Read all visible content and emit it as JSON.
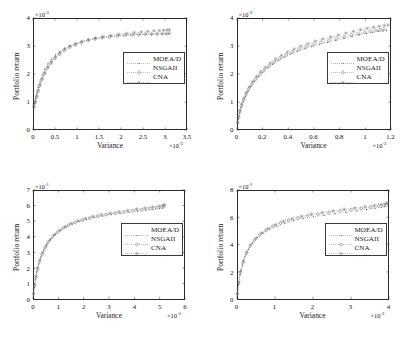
{
  "figure": {
    "layout": "2x2 grid of scatter/line plots",
    "background": "#ffffff",
    "axis_color": "#2b2b2b"
  },
  "legend": {
    "entries": [
      {
        "label": "MOEA/D",
        "marker": "dot",
        "color": "#555555"
      },
      {
        "label": "NSGAII",
        "marker": "diamond",
        "color": "#666666"
      },
      {
        "label": "CNA",
        "marker": "star",
        "color": "#777777"
      }
    ]
  },
  "chart_data": [
    {
      "id": "top-left",
      "type": "scatter",
      "title": "",
      "xlabel": "Variance",
      "ylabel": "Portfolio return",
      "x_multiplier": "×10",
      "x_exponent": "-3",
      "y_multiplier": "×10",
      "y_exponent": "-3",
      "xlim": [
        0,
        3.5
      ],
      "ylim": [
        0,
        4
      ],
      "xticks": [
        "0",
        "0.5",
        "1",
        "1.5",
        "2",
        "2.5",
        "3",
        "3.5"
      ],
      "yticks": [
        "0",
        "1",
        "2",
        "3",
        "4"
      ],
      "grid": false,
      "legend_position": "center-right",
      "series": [
        {
          "name": "MOEA/D",
          "x": [
            0.02,
            0.04,
            0.06,
            0.09,
            0.12,
            0.16,
            0.21,
            0.27,
            0.34,
            0.42,
            0.51,
            0.61,
            0.72,
            0.84,
            0.97,
            1.11,
            1.26,
            1.42,
            1.59,
            1.77,
            1.95,
            2.12,
            2.28,
            2.43,
            2.57,
            2.7,
            2.82,
            2.93,
            3.02,
            3.09
          ],
          "y": [
            0.8,
            0.95,
            1.12,
            1.32,
            1.52,
            1.74,
            1.96,
            2.17,
            2.36,
            2.53,
            2.68,
            2.81,
            2.92,
            3.01,
            3.09,
            3.16,
            3.22,
            3.27,
            3.31,
            3.34,
            3.37,
            3.39,
            3.4,
            3.41,
            3.42,
            3.42,
            3.43,
            3.43,
            3.43,
            3.44
          ]
        },
        {
          "name": "NSGAII",
          "x": [
            0.02,
            0.05,
            0.08,
            0.11,
            0.15,
            0.2,
            0.26,
            0.33,
            0.41,
            0.5,
            0.6,
            0.71,
            0.83,
            0.96,
            1.1,
            1.25,
            1.41,
            1.57,
            1.74,
            1.91,
            2.08,
            2.24,
            2.4,
            2.55,
            2.69,
            2.82,
            2.94,
            3.04,
            3.1
          ],
          "y": [
            0.82,
            0.99,
            1.18,
            1.38,
            1.58,
            1.8,
            2.01,
            2.21,
            2.39,
            2.56,
            2.71,
            2.84,
            2.95,
            3.04,
            3.12,
            3.19,
            3.25,
            3.29,
            3.33,
            3.36,
            3.38,
            3.4,
            3.41,
            3.42,
            3.43,
            3.43,
            3.44,
            3.44,
            3.45
          ]
        },
        {
          "name": "CNA",
          "x": [
            0.02,
            0.05,
            0.08,
            0.12,
            0.16,
            0.21,
            0.27,
            0.34,
            0.42,
            0.51,
            0.61,
            0.72,
            0.84,
            0.97,
            1.11,
            1.26,
            1.42,
            1.59,
            1.77,
            1.95,
            2.13,
            2.3,
            2.46,
            2.61,
            2.75,
            2.87,
            2.97,
            3.05,
            3.1
          ],
          "y": [
            0.84,
            1.02,
            1.22,
            1.42,
            1.63,
            1.84,
            2.05,
            2.25,
            2.43,
            2.6,
            2.75,
            2.88,
            2.99,
            3.08,
            3.16,
            3.23,
            3.29,
            3.34,
            3.38,
            3.42,
            3.45,
            3.48,
            3.5,
            3.52,
            3.54,
            3.55,
            3.56,
            3.57,
            3.58
          ]
        }
      ]
    },
    {
      "id": "top-right",
      "type": "scatter",
      "title": "",
      "xlabel": "Variance",
      "ylabel": "Portfolio return",
      "x_multiplier": "×10",
      "x_exponent": "-3",
      "y_multiplier": "×10",
      "y_exponent": "-3",
      "xlim": [
        0,
        1.3
      ],
      "ylim": [
        0,
        4
      ],
      "xticks": [
        "0",
        "0.2",
        "0.4",
        "0.6",
        "0.8",
        "1",
        "1.2"
      ],
      "yticks": [
        "0",
        "1",
        "2",
        "3",
        "4"
      ],
      "grid": false,
      "legend_position": "center-right",
      "series": [
        {
          "name": "MOEA/D",
          "x": [
            0.005,
            0.012,
            0.022,
            0.035,
            0.051,
            0.07,
            0.093,
            0.119,
            0.148,
            0.181,
            0.217,
            0.257,
            0.3,
            0.347,
            0.397,
            0.451,
            0.508,
            0.568,
            0.631,
            0.697,
            0.765,
            0.834,
            0.903,
            0.97,
            1.033,
            1.092,
            1.145,
            1.192,
            1.232,
            1.263
          ],
          "y": [
            0.22,
            0.4,
            0.6,
            0.8,
            1.0,
            1.19,
            1.38,
            1.56,
            1.73,
            1.9,
            2.06,
            2.21,
            2.35,
            2.48,
            2.6,
            2.71,
            2.81,
            2.9,
            2.98,
            3.06,
            3.13,
            3.2,
            3.27,
            3.34,
            3.4,
            3.45,
            3.49,
            3.52,
            3.54,
            3.56
          ]
        },
        {
          "name": "NSGAII",
          "x": [
            0.005,
            0.013,
            0.024,
            0.038,
            0.055,
            0.075,
            0.099,
            0.126,
            0.157,
            0.191,
            0.229,
            0.27,
            0.314,
            0.362,
            0.413,
            0.467,
            0.524,
            0.584,
            0.646,
            0.71,
            0.775,
            0.84,
            0.904,
            0.966,
            1.024,
            1.078,
            1.127,
            1.17,
            1.208,
            1.24
          ],
          "y": [
            0.25,
            0.45,
            0.66,
            0.87,
            1.07,
            1.27,
            1.46,
            1.64,
            1.81,
            1.98,
            2.13,
            2.28,
            2.42,
            2.55,
            2.67,
            2.78,
            2.88,
            2.97,
            3.05,
            3.13,
            3.2,
            3.27,
            3.33,
            3.39,
            3.44,
            3.49,
            3.53,
            3.56,
            3.58,
            3.6
          ]
        },
        {
          "name": "CNA",
          "x": [
            0.005,
            0.013,
            0.025,
            0.04,
            0.058,
            0.079,
            0.104,
            0.132,
            0.164,
            0.199,
            0.238,
            0.28,
            0.325,
            0.374,
            0.426,
            0.481,
            0.539,
            0.599,
            0.661,
            0.725,
            0.79,
            0.855,
            0.919,
            0.982,
            1.042,
            1.099,
            1.152,
            1.2,
            1.243,
            1.275
          ],
          "y": [
            0.27,
            0.48,
            0.7,
            0.92,
            1.13,
            1.34,
            1.54,
            1.73,
            1.91,
            2.08,
            2.24,
            2.39,
            2.53,
            2.66,
            2.78,
            2.89,
            2.99,
            3.08,
            3.17,
            3.25,
            3.32,
            3.39,
            3.46,
            3.52,
            3.58,
            3.63,
            3.67,
            3.7,
            3.73,
            3.75
          ]
        }
      ]
    },
    {
      "id": "bottom-left",
      "type": "scatter",
      "title": "",
      "xlabel": "Variance",
      "ylabel": "Portfolio return",
      "x_multiplier": "×10",
      "x_exponent": "-3",
      "y_multiplier": "×10",
      "y_exponent": "-1",
      "xlim": [
        0,
        6
      ],
      "ylim": [
        0,
        7
      ],
      "xticks": [
        "0",
        "1",
        "2",
        "3",
        "4",
        "5",
        "6"
      ],
      "yticks": [
        "0",
        "1",
        "2",
        "3",
        "4",
        "5",
        "6",
        "7"
      ],
      "grid": false,
      "legend_position": "center-right",
      "series": [
        {
          "name": "MOEA/D",
          "x": [
            0.02,
            0.05,
            0.09,
            0.15,
            0.22,
            0.31,
            0.42,
            0.55,
            0.7,
            0.88,
            1.08,
            1.3,
            1.55,
            1.82,
            2.11,
            2.42,
            2.75,
            3.09,
            3.44,
            3.79,
            4.13,
            4.45,
            4.74,
            4.99,
            5.13
          ],
          "y": [
            0.3,
            0.75,
            1.25,
            1.75,
            2.25,
            2.72,
            3.15,
            3.53,
            3.86,
            4.15,
            4.4,
            4.62,
            4.81,
            4.97,
            5.11,
            5.23,
            5.33,
            5.42,
            5.5,
            5.57,
            5.64,
            5.7,
            5.76,
            5.81,
            5.84
          ]
        },
        {
          "name": "NSGAII",
          "x": [
            0.02,
            0.06,
            0.11,
            0.17,
            0.25,
            0.35,
            0.47,
            0.61,
            0.77,
            0.96,
            1.17,
            1.4,
            1.66,
            1.94,
            2.24,
            2.56,
            2.89,
            3.24,
            3.59,
            3.94,
            4.28,
            4.59,
            4.87,
            5.08,
            5.18
          ],
          "y": [
            0.35,
            0.85,
            1.38,
            1.9,
            2.4,
            2.87,
            3.29,
            3.67,
            4.0,
            4.28,
            4.53,
            4.74,
            4.92,
            5.07,
            5.2,
            5.32,
            5.42,
            5.51,
            5.59,
            5.67,
            5.74,
            5.81,
            5.87,
            5.92,
            5.95
          ]
        },
        {
          "name": "CNA",
          "x": [
            0.02,
            0.06,
            0.12,
            0.19,
            0.28,
            0.39,
            0.52,
            0.67,
            0.84,
            1.04,
            1.26,
            1.5,
            1.77,
            2.06,
            2.37,
            2.7,
            3.04,
            3.39,
            3.74,
            4.09,
            4.42,
            4.72,
            4.98,
            5.14,
            5.2
          ],
          "y": [
            0.38,
            0.92,
            1.48,
            2.02,
            2.53,
            3.0,
            3.42,
            3.8,
            4.13,
            4.41,
            4.65,
            4.86,
            5.03,
            5.18,
            5.31,
            5.42,
            5.52,
            5.61,
            5.69,
            5.77,
            5.84,
            5.91,
            5.97,
            6.02,
            6.05
          ]
        }
      ]
    },
    {
      "id": "bottom-right",
      "type": "scatter",
      "title": "",
      "xlabel": "Variance",
      "ylabel": "Portfolio return",
      "x_multiplier": "×10",
      "x_exponent": "-3",
      "y_multiplier": "×10",
      "y_exponent": "-1",
      "xlim": [
        0,
        4
      ],
      "ylim": [
        0,
        8
      ],
      "xticks": [
        "0",
        "1",
        "2",
        "3",
        "4"
      ],
      "yticks": [
        "0",
        "2",
        "4",
        "6",
        "8"
      ],
      "grid": false,
      "legend_position": "center-right",
      "series": [
        {
          "name": "MOEA/D",
          "x": [
            0.01,
            0.04,
            0.08,
            0.14,
            0.21,
            0.3,
            0.41,
            0.54,
            0.69,
            0.86,
            1.05,
            1.26,
            1.49,
            1.74,
            2.01,
            2.29,
            2.58,
            2.87,
            3.15,
            3.41,
            3.63,
            3.8,
            3.89
          ],
          "y": [
            0.35,
            1.05,
            1.8,
            2.5,
            3.12,
            3.66,
            4.12,
            4.51,
            4.84,
            5.12,
            5.36,
            5.57,
            5.75,
            5.9,
            6.03,
            6.15,
            6.26,
            6.37,
            6.47,
            6.57,
            6.66,
            6.73,
            6.78
          ]
        },
        {
          "name": "NSGAII",
          "x": [
            0.01,
            0.04,
            0.09,
            0.16,
            0.24,
            0.34,
            0.46,
            0.6,
            0.76,
            0.94,
            1.14,
            1.36,
            1.6,
            1.86,
            2.13,
            2.42,
            2.71,
            3.0,
            3.27,
            3.52,
            3.72,
            3.86,
            3.93
          ],
          "y": [
            0.4,
            1.18,
            1.98,
            2.7,
            3.33,
            3.88,
            4.34,
            4.73,
            5.06,
            5.34,
            5.58,
            5.78,
            5.95,
            6.1,
            6.23,
            6.35,
            6.46,
            6.56,
            6.65,
            6.74,
            6.82,
            6.88,
            6.92
          ]
        },
        {
          "name": "CNA",
          "x": [
            0.01,
            0.05,
            0.1,
            0.17,
            0.26,
            0.37,
            0.5,
            0.65,
            0.82,
            1.01,
            1.22,
            1.45,
            1.7,
            1.96,
            2.24,
            2.53,
            2.82,
            3.1,
            3.37,
            3.61,
            3.79,
            3.91,
            3.96
          ],
          "y": [
            0.42,
            1.25,
            2.08,
            2.82,
            3.46,
            4.01,
            4.47,
            4.86,
            5.19,
            5.46,
            5.7,
            5.9,
            6.07,
            6.22,
            6.35,
            6.47,
            6.58,
            6.68,
            6.77,
            6.86,
            6.93,
            6.99,
            7.03
          ]
        }
      ]
    }
  ]
}
